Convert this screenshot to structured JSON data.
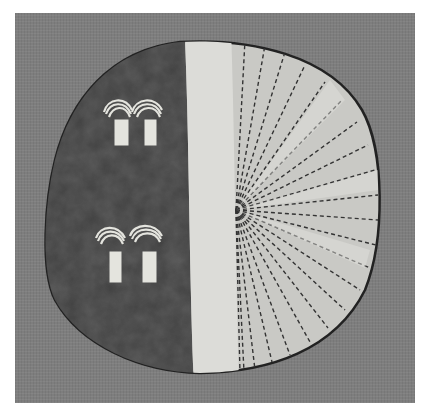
{
  "image": {
    "subject": "painted round hide shield",
    "background": "linen textile",
    "palette": {
      "frame": "#7e7e7e",
      "dark_field": "#3c3c3c",
      "light_band": "#d8d8d4",
      "rayed_field": "#c8c8c4",
      "ray_dash": "#333333",
      "motif": "#e6e6e0"
    },
    "motifs": [
      {
        "name": "upper-pair",
        "count": 2
      },
      {
        "name": "lower-pair",
        "count": 2
      }
    ],
    "ray_count": 22
  }
}
